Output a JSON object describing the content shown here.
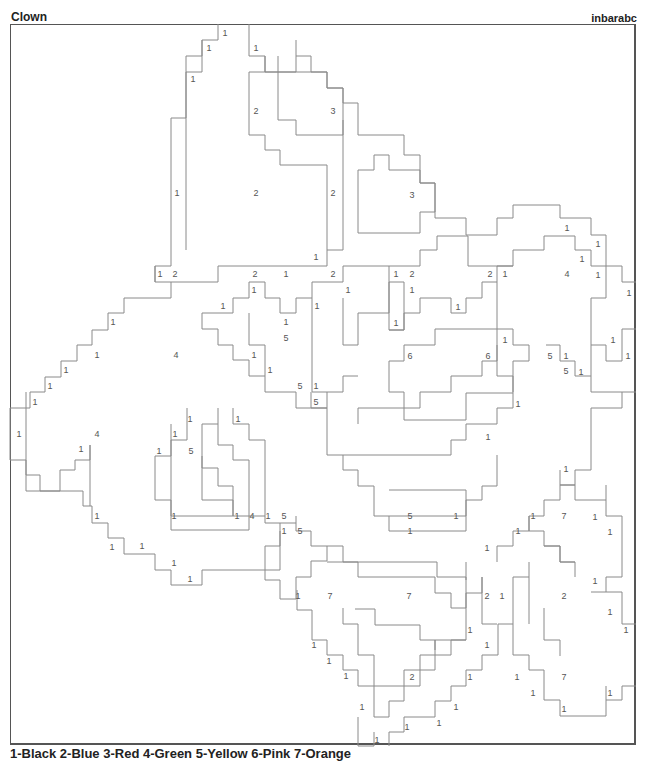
{
  "header": {
    "title": "Clown",
    "author": "inbarabc"
  },
  "legend": {
    "text": "1-Black 2-Blue 3-Red 4-Green 5-Yellow 6-Pink 7-Orange"
  },
  "labels": [
    {
      "x": 225,
      "y": 33,
      "v": "1"
    },
    {
      "x": 209,
      "y": 48,
      "v": "1"
    },
    {
      "x": 256,
      "y": 48,
      "v": "1"
    },
    {
      "x": 193,
      "y": 79,
      "v": "1"
    },
    {
      "x": 256,
      "y": 111,
      "v": "2"
    },
    {
      "x": 333,
      "y": 111,
      "v": "3"
    },
    {
      "x": 177,
      "y": 193,
      "v": "1"
    },
    {
      "x": 256,
      "y": 193,
      "v": "2"
    },
    {
      "x": 333,
      "y": 193,
      "v": "2"
    },
    {
      "x": 412,
      "y": 195,
      "v": "3"
    },
    {
      "x": 316,
      "y": 257,
      "v": "1"
    },
    {
      "x": 567,
      "y": 228,
      "v": "1"
    },
    {
      "x": 598,
      "y": 244,
      "v": "1"
    },
    {
      "x": 582,
      "y": 259,
      "v": "1"
    },
    {
      "x": 160,
      "y": 274,
      "v": "1"
    },
    {
      "x": 175,
      "y": 274,
      "v": "2"
    },
    {
      "x": 255,
      "y": 274,
      "v": "2"
    },
    {
      "x": 286,
      "y": 274,
      "v": "1"
    },
    {
      "x": 333,
      "y": 274,
      "v": "2"
    },
    {
      "x": 396,
      "y": 274,
      "v": "1"
    },
    {
      "x": 412,
      "y": 274,
      "v": "2"
    },
    {
      "x": 490,
      "y": 274,
      "v": "2"
    },
    {
      "x": 505,
      "y": 274,
      "v": "1"
    },
    {
      "x": 567,
      "y": 274,
      "v": "4"
    },
    {
      "x": 598,
      "y": 275,
      "v": "1"
    },
    {
      "x": 254,
      "y": 290,
      "v": "1"
    },
    {
      "x": 348,
      "y": 290,
      "v": "1"
    },
    {
      "x": 412,
      "y": 290,
      "v": "1"
    },
    {
      "x": 629,
      "y": 293,
      "v": "1"
    },
    {
      "x": 223,
      "y": 306,
      "v": "1"
    },
    {
      "x": 458,
      "y": 307,
      "v": "1"
    },
    {
      "x": 113,
      "y": 322,
      "v": "1"
    },
    {
      "x": 286,
      "y": 322,
      "v": "1"
    },
    {
      "x": 317,
      "y": 306,
      "v": "1"
    },
    {
      "x": 396,
      "y": 323,
      "v": "1"
    },
    {
      "x": 286,
      "y": 338,
      "v": "5"
    },
    {
      "x": 505,
      "y": 340,
      "v": "1"
    },
    {
      "x": 613,
      "y": 340,
      "v": "1"
    },
    {
      "x": 97,
      "y": 355,
      "v": "1"
    },
    {
      "x": 176,
      "y": 355,
      "v": "4"
    },
    {
      "x": 254,
      "y": 355,
      "v": "1"
    },
    {
      "x": 410,
      "y": 356,
      "v": "6"
    },
    {
      "x": 488,
      "y": 356,
      "v": "6"
    },
    {
      "x": 550,
      "y": 356,
      "v": "5"
    },
    {
      "x": 566,
      "y": 356,
      "v": "1"
    },
    {
      "x": 628,
      "y": 356,
      "v": "1"
    },
    {
      "x": 66,
      "y": 370,
      "v": "1"
    },
    {
      "x": 270,
      "y": 370,
      "v": "1"
    },
    {
      "x": 566,
      "y": 371,
      "v": "5"
    },
    {
      "x": 581,
      "y": 372,
      "v": "1"
    },
    {
      "x": 50,
      "y": 386,
      "v": "1"
    },
    {
      "x": 300,
      "y": 386,
      "v": "5"
    },
    {
      "x": 316,
      "y": 386,
      "v": "1"
    },
    {
      "x": 35,
      "y": 402,
      "v": "1"
    },
    {
      "x": 316,
      "y": 402,
      "v": "5"
    },
    {
      "x": 518,
      "y": 404,
      "v": "1"
    },
    {
      "x": 190,
      "y": 419,
      "v": "1"
    },
    {
      "x": 238,
      "y": 419,
      "v": "1"
    },
    {
      "x": 19,
      "y": 434,
      "v": "1"
    },
    {
      "x": 97,
      "y": 434,
      "v": "4"
    },
    {
      "x": 175,
      "y": 434,
      "v": "1"
    },
    {
      "x": 488,
      "y": 437,
      "v": "1"
    },
    {
      "x": 81,
      "y": 449,
      "v": "1"
    },
    {
      "x": 159,
      "y": 451,
      "v": "1"
    },
    {
      "x": 191,
      "y": 451,
      "v": "5"
    },
    {
      "x": 566,
      "y": 469,
      "v": "1"
    },
    {
      "x": 174,
      "y": 516,
      "v": "1"
    },
    {
      "x": 237,
      "y": 516,
      "v": "1"
    },
    {
      "x": 252,
      "y": 516,
      "v": "4"
    },
    {
      "x": 268,
      "y": 516,
      "v": "1"
    },
    {
      "x": 284,
      "y": 516,
      "v": "5"
    },
    {
      "x": 410,
      "y": 516,
      "v": "5"
    },
    {
      "x": 456,
      "y": 516,
      "v": "1"
    },
    {
      "x": 97,
      "y": 516,
      "v": "1"
    },
    {
      "x": 533,
      "y": 516,
      "v": "1"
    },
    {
      "x": 564,
      "y": 516,
      "v": "7"
    },
    {
      "x": 595,
      "y": 517,
      "v": "1"
    },
    {
      "x": 284,
      "y": 531,
      "v": "1"
    },
    {
      "x": 300,
      "y": 531,
      "v": "5"
    },
    {
      "x": 410,
      "y": 531,
      "v": "1"
    },
    {
      "x": 518,
      "y": 531,
      "v": "1"
    },
    {
      "x": 610,
      "y": 532,
      "v": "1"
    },
    {
      "x": 112,
      "y": 547,
      "v": "1"
    },
    {
      "x": 142,
      "y": 546,
      "v": "1"
    },
    {
      "x": 487,
      "y": 548,
      "v": "1"
    },
    {
      "x": 174,
      "y": 563,
      "v": "1"
    },
    {
      "x": 190,
      "y": 579,
      "v": "1"
    },
    {
      "x": 595,
      "y": 581,
      "v": "1"
    },
    {
      "x": 298,
      "y": 596,
      "v": "1"
    },
    {
      "x": 330,
      "y": 596,
      "v": "7"
    },
    {
      "x": 409,
      "y": 596,
      "v": "7"
    },
    {
      "x": 487,
      "y": 596,
      "v": "2"
    },
    {
      "x": 502,
      "y": 596,
      "v": "1"
    },
    {
      "x": 564,
      "y": 596,
      "v": "2"
    },
    {
      "x": 610,
      "y": 612,
      "v": "1"
    },
    {
      "x": 626,
      "y": 630,
      "v": "1"
    },
    {
      "x": 470,
      "y": 630,
      "v": "1"
    },
    {
      "x": 314,
      "y": 645,
      "v": "1"
    },
    {
      "x": 487,
      "y": 645,
      "v": "1"
    },
    {
      "x": 329,
      "y": 661,
      "v": "1"
    },
    {
      "x": 346,
      "y": 676,
      "v": "1"
    },
    {
      "x": 412,
      "y": 677,
      "v": "2"
    },
    {
      "x": 470,
      "y": 677,
      "v": "1"
    },
    {
      "x": 517,
      "y": 677,
      "v": "1"
    },
    {
      "x": 564,
      "y": 677,
      "v": "7"
    },
    {
      "x": 533,
      "y": 693,
      "v": "1"
    },
    {
      "x": 610,
      "y": 693,
      "v": "1"
    },
    {
      "x": 362,
      "y": 707,
      "v": "1"
    },
    {
      "x": 456,
      "y": 707,
      "v": "1"
    },
    {
      "x": 564,
      "y": 709,
      "v": "1"
    },
    {
      "x": 439,
      "y": 723,
      "v": "1"
    },
    {
      "x": 407,
      "y": 727,
      "v": "1"
    },
    {
      "x": 377,
      "y": 740,
      "v": "1"
    }
  ],
  "regions": [
    "218,24 218,40 202,40 202,56 186,56 186,118 171,118 171,266 155,266 155,282",
    "249,24 249,56 265,56 265,72 327,72 327,88 343,88 343,103 358,103 358,135 404,135 404,155 420,155 420,183 435,183 435,218 466,218 466,235 497,235 497,218 513,218 513,205 560,205 560,218 591,218 591,235 606,235 606,266 622,266 622,282 636,282",
    "202,40 202,72 186,72 186,250",
    "265,56 265,72 249,72 249,135 265,135 265,150 280,150 280,165 327,165 327,250",
    "278,56 278,72 265,72",
    "296,40 296,72 278,72 278,120 296,120 296,135 343,135 343,88 327,88 327,72 311,72 311,56 296,56",
    "374,155 374,170 358,170 358,233 389,233 420,233 420,212 435,212 435,183 420,183 420,170 389,170 389,155 374,155",
    "343,120 343,250 327,250 327,266 218,266 218,282 171,282 171,298 124,298 124,313 108,313 108,330 92,330 92,345 77,345 77,361 61,361 61,377 45,377 45,392 30,392 30,408 10,408",
    "155,266 155,282 171,282",
    "437,236 437,250 420,250 420,266 343,266 343,282 312,282 312,298 296,298 296,313 280,313 280,298 265,298 265,282 249,282 249,298 233,298 233,313 202,313 202,329 218,329 218,345 233,345 233,360 249,360 249,376 265,376 265,392 296,392 296,408 327,408 327,392 343,392 343,376 358,376",
    "437,236 468,236 468,266 513,266 513,250 544,250 544,236 575,236 575,250 591,250 591,266 606,266 606,298 591,298 591,345 606,345 606,361 622,361 622,329 636,329",
    "389,266 389,330 404,330 404,313 420,313 420,298 451,298 451,313 466,313 466,298 482,298 482,282 497,282 497,266 513,266",
    "312,298 312,392 327,392",
    "343,298 343,345 358,345 358,313 389,313 389,282 404,282 404,330 389,330",
    "497,282 497,361 482,361 482,376 451,376 451,392 420,392 420,408 404,408 404,392 389,392 389,361 404,361 404,345 435,345 435,329 513,329 513,345 529,345 529,345",
    "249,313 249,345 265,345 265,376",
    "546,345 560,345 560,361 575,361 575,376 591,376 591,392 636,392",
    "497,345 497,376 513,376 513,408 497,408 497,424 466,424 466,440 451,440 451,455 327,455 327,408 311,408 311,392",
    "529,345 529,361 513,361 513,392",
    "591,345 591,376",
    "622,392 622,408 591,408 591,470 575,470 575,485 560,485 560,500 544,500 544,516 529,516 529,531 513,531 513,546 497,546 497,562",
    "10,408 10,460 26,460 26,475 40,475 40,491 60,491 60,470 75,470 75,460 90,460 90,445",
    "26,392 26,491 83,491 83,506 92,506 92,523 108,523 108,538 124,538 124,554 155,554 155,570 171,570 171,585 187,585 202,585 202,570 280,570 280,523 296,523",
    "90,445 90,506",
    "233,408 233,424 249,424 249,440 265,440 265,523 280,523",
    "218,408 218,424 202,424 202,500 233,500 233,516 265,516",
    "187,408 187,440 171,440 171,456 155,456 155,500 171,500 171,516 233,516 233,486 218,486 218,468 202,468 202,456",
    "171,424 171,530 249,530 249,460 233,460 233,445 218,445 218,424",
    "358,424 358,408 404,408 404,420 466,420 466,393 513,393",
    "343,455 343,470 358,470 358,486 374,486 374,516 466,516 466,500 482,500 482,486 497,486 497,455",
    "389,490 466,490 466,531 389,531 389,516",
    "296,516 296,531 311,531 311,546 343,546 343,562 437,562 437,577 466,577 466,580",
    "560,470 560,485 575,485 575,500 606,500 606,516 622,516 622,577 606,577 606,592 622,592 622,624 636,624",
    "280,531 280,546 265,546 265,580 280,580 280,599 296,599 296,577 311,577 311,561 327,561 327,546",
    "606,485 606,500",
    "529,516 529,531 544,531 544,546 560,546 560,562 575,562 575,577",
    "482,577 482,593 466,593 466,608 451,608 451,593 435,593 435,577 358,577 358,562 327,562",
    "297,590 297,610 312,610 312,640 327,640 327,655 343,655 343,670 358,670 358,686 374,686 374,717 389,717 389,701 404,701 404,686 420,686 420,670 435,670 435,655 451,655 451,640 466,640",
    "343,608 343,624 358,624 358,655 374,655 374,686 404,686 404,670 420,670 420,655 435,655 435,640 466,640",
    "529,562 529,577 513,577 513,624 498,624 498,655 482,655 482,670 466,670 466,686 451,686 451,701 435,701 435,717 404,717 404,732 389,732 389,746",
    "355,609 375,609 375,625 420,625 420,640 435,640 435,650",
    "466,562 466,640",
    "482,577 482,624 497,624",
    "513,624 513,655 529,655 529,670 544,670 544,700 560,700 560,716 606,716 606,700 622,700 622,686 636,686",
    "544,546 560,546 560,562 575,562",
    "544,608 544,640 560,640 560,656",
    "529,577 529,624",
    "591,592 606,592",
    "358,717 358,746 374,746 374,732",
    "606,686 606,700"
  ]
}
